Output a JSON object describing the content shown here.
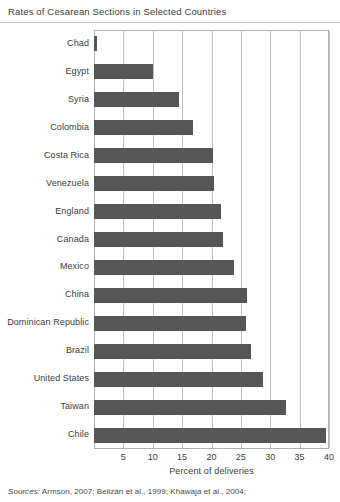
{
  "title": "Rates of Cesarean Sections in Selected Countries",
  "sources": {
    "label": "Sources:",
    "text": "Armson, 2007; Belizán et al., 1999; Khawaja et al., 2004;"
  },
  "axis": {
    "xlabel": "Percent of deliveries",
    "ticks": [
      "5",
      "10",
      "15",
      "20",
      "25",
      "30",
      "35",
      "40"
    ]
  },
  "colors": {
    "bar": "#565656",
    "grid": "#c4c4c4",
    "frame": "#b0b0b0",
    "text": "#3c3c3c"
  },
  "chart_data": {
    "type": "bar",
    "orientation": "horizontal",
    "title": "Rates of Cesarean Sections in Selected Countries",
    "xlabel": "Percent of deliveries",
    "ylabel": "",
    "xlim": [
      0,
      40
    ],
    "xticks": [
      5,
      10,
      15,
      20,
      25,
      30,
      35,
      40
    ],
    "grid": "vertical",
    "legend": "none",
    "categories": [
      "Chad",
      "Egypt",
      "Syria",
      "Colombia",
      "Costa Rica",
      "Venezuela",
      "England",
      "Canada",
      "Mexico",
      "China",
      "Dominican Republic",
      "Brazil",
      "United States",
      "Taiwan",
      "Chile"
    ],
    "values": [
      0.5,
      10,
      14.5,
      16.8,
      20.3,
      20.5,
      21.7,
      22,
      23.8,
      26,
      25.8,
      26.7,
      28.8,
      32.7,
      39.5
    ],
    "units": "percent of deliveries"
  },
  "bars": [
    {
      "label": "Chad",
      "value": 0.5
    },
    {
      "label": "Egypt",
      "value": 10
    },
    {
      "label": "Syria",
      "value": 14.5
    },
    {
      "label": "Colombia",
      "value": 16.8
    },
    {
      "label": "Costa Rica",
      "value": 20.3
    },
    {
      "label": "Venezuela",
      "value": 20.5
    },
    {
      "label": "England",
      "value": 21.7
    },
    {
      "label": "Canada",
      "value": 22
    },
    {
      "label": "Mexico",
      "value": 23.8
    },
    {
      "label": "China",
      "value": 26
    },
    {
      "label": "Dominican Republic",
      "value": 25.8
    },
    {
      "label": "Brazil",
      "value": 26.7
    },
    {
      "label": "United States",
      "value": 28.8
    },
    {
      "label": "Taiwan",
      "value": 32.7
    },
    {
      "label": "Chile",
      "value": 39.5
    }
  ]
}
